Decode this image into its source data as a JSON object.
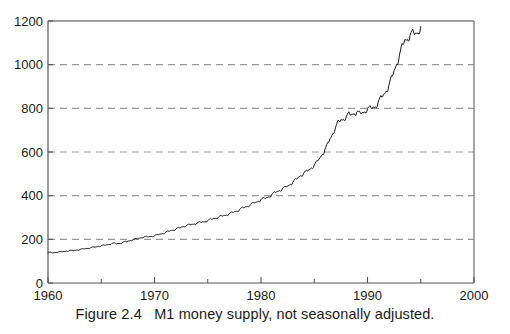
{
  "figure": {
    "caption": "Figure 2.4   M1 money supply, not seasonally adjusted."
  },
  "chart_data": {
    "type": "line",
    "title": "",
    "subtitle": "",
    "xlabel": "",
    "ylabel": "",
    "xlim": [
      1960,
      2000
    ],
    "ylim": [
      0,
      1200
    ],
    "xticks": [
      1960,
      1970,
      1980,
      1990,
      2000
    ],
    "xtick_labels": [
      "1960",
      "1970",
      "1980",
      "1990",
      "2000"
    ],
    "xminor_ticks": [
      1965,
      1975,
      1985,
      1995
    ],
    "yticks": [
      0,
      200,
      400,
      600,
      800,
      1000,
      1200
    ],
    "ytick_labels": [
      "0",
      "200",
      "400",
      "600",
      "800",
      "1000",
      "1200"
    ],
    "grid": "horizontal-dashed",
    "gridlines_y": [
      200,
      400,
      600,
      800,
      1000
    ],
    "legend": "none",
    "line_color": "#1a1a1a",
    "grid_color": "#999999",
    "frame_color": "#808080",
    "background": "#ffffff",
    "series": [
      {
        "name": "M1 money supply, not seasonally adjusted",
        "units": "billions of dollars",
        "x": [
          1960.0,
          1960.25,
          1960.5,
          1960.75,
          1961.0,
          1961.25,
          1961.5,
          1961.75,
          1962.0,
          1962.25,
          1962.5,
          1962.75,
          1963.0,
          1963.25,
          1963.5,
          1963.75,
          1964.0,
          1964.25,
          1964.5,
          1964.75,
          1965.0,
          1965.25,
          1965.5,
          1965.75,
          1966.0,
          1966.25,
          1966.5,
          1966.75,
          1967.0,
          1967.25,
          1967.5,
          1967.75,
          1968.0,
          1968.25,
          1968.5,
          1968.75,
          1969.0,
          1969.25,
          1969.5,
          1969.75,
          1970.0,
          1970.25,
          1970.5,
          1970.75,
          1971.0,
          1971.25,
          1971.5,
          1971.75,
          1972.0,
          1972.25,
          1972.5,
          1972.75,
          1973.0,
          1973.25,
          1973.5,
          1973.75,
          1974.0,
          1974.25,
          1974.5,
          1974.75,
          1975.0,
          1975.25,
          1975.5,
          1975.75,
          1976.0,
          1976.25,
          1976.5,
          1976.75,
          1977.0,
          1977.25,
          1977.5,
          1977.75,
          1978.0,
          1978.25,
          1978.5,
          1978.75,
          1979.0,
          1979.25,
          1979.5,
          1979.75,
          1980.0,
          1980.25,
          1980.5,
          1980.75,
          1981.0,
          1981.25,
          1981.5,
          1981.75,
          1982.0,
          1982.25,
          1982.5,
          1982.75,
          1983.0,
          1983.25,
          1983.5,
          1983.75,
          1984.0,
          1984.25,
          1984.5,
          1984.75,
          1985.0,
          1985.25,
          1985.5,
          1985.75,
          1986.0,
          1986.25,
          1986.5,
          1986.75,
          1987.0,
          1987.25,
          1987.5,
          1987.75,
          1988.0,
          1988.25,
          1988.5,
          1988.75,
          1989.0,
          1989.25,
          1989.5,
          1989.75,
          1990.0,
          1990.25,
          1990.5,
          1990.75,
          1991.0,
          1991.25,
          1991.5,
          1991.75,
          1992.0,
          1992.25,
          1992.5,
          1992.75,
          1993.0,
          1993.25,
          1993.5,
          1993.75,
          1994.0,
          1994.25,
          1994.5,
          1994.75,
          1995.0
        ],
        "values": [
          140,
          139,
          138,
          141,
          142,
          143,
          144,
          147,
          148,
          148,
          149,
          152,
          153,
          155,
          157,
          160,
          161,
          163,
          165,
          169,
          170,
          172,
          174,
          178,
          180,
          181,
          180,
          183,
          185,
          188,
          191,
          196,
          198,
          201,
          204,
          209,
          210,
          211,
          212,
          215,
          216,
          219,
          223,
          228,
          230,
          235,
          239,
          244,
          246,
          251,
          255,
          261,
          263,
          266,
          268,
          272,
          274,
          277,
          279,
          283,
          285,
          290,
          294,
          299,
          301,
          305,
          308,
          313,
          316,
          321,
          326,
          332,
          336,
          342,
          347,
          354,
          358,
          364,
          369,
          377,
          381,
          386,
          389,
          398,
          402,
          412,
          418,
          426,
          430,
          437,
          443,
          455,
          460,
          472,
          483,
          496,
          500,
          509,
          518,
          531,
          538,
          553,
          570,
          593,
          608,
          633,
          660,
          690,
          710,
          735,
          745,
          755,
          758,
          772,
          770,
          782,
          780,
          775,
          778,
          790,
          795,
          800,
          802,
          812,
          825,
          845,
          860,
          885,
          900,
          935,
          970,
          1010,
          1040,
          1080,
          1110,
          1125,
          1130,
          1145,
          1140,
          1155,
          1170
        ]
      }
    ]
  },
  "axes": {
    "x_tick_labels": [
      "1960",
      "1970",
      "1980",
      "1990",
      "2000"
    ],
    "y_tick_labels": [
      "0",
      "200",
      "400",
      "600",
      "800",
      "1000",
      "1200"
    ]
  }
}
